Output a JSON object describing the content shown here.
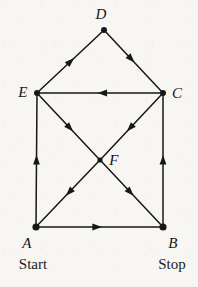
{
  "figure": {
    "kind": "directed-graph",
    "background_color": "#f7f6f2",
    "ink_color": "#17161a",
    "width": 198,
    "height": 287
  },
  "graph": {
    "nodes": [
      {
        "id": "A",
        "label": "A",
        "x": 36,
        "y": 227,
        "label_x": 27,
        "label_y": 243,
        "radius": 3.6
      },
      {
        "id": "B",
        "label": "B",
        "x": 163,
        "y": 227,
        "label_x": 173,
        "label_y": 243,
        "radius": 3.6
      },
      {
        "id": "C",
        "label": "C",
        "x": 163,
        "y": 93,
        "label_x": 177,
        "label_y": 93,
        "radius": 3.0
      },
      {
        "id": "D",
        "label": "D",
        "x": 104,
        "y": 30,
        "label_x": 101,
        "label_y": 14,
        "radius": 3.0
      },
      {
        "id": "E",
        "label": "E",
        "x": 37,
        "y": 93,
        "label_x": 23,
        "label_y": 92,
        "radius": 3.0
      },
      {
        "id": "F",
        "label": "F",
        "x": 100,
        "y": 160,
        "label_x": 114,
        "label_y": 160,
        "radius": 2.6
      }
    ],
    "edges": [
      {
        "id": "A-B",
        "from": "A",
        "to": "B",
        "directed": true,
        "arrow_t": 0.48
      },
      {
        "id": "A-E",
        "from": "A",
        "to": "E",
        "directed": true,
        "arrow_t": 0.5
      },
      {
        "id": "B-C",
        "from": "B",
        "to": "C",
        "directed": true,
        "arrow_t": 0.5
      },
      {
        "id": "E-D",
        "from": "E",
        "to": "D",
        "directed": true,
        "arrow_t": 0.5
      },
      {
        "id": "D-C",
        "from": "D",
        "to": "C",
        "directed": true,
        "arrow_t": 0.46
      },
      {
        "id": "C-E",
        "from": "C",
        "to": "E",
        "directed": true,
        "arrow_t": 0.48
      },
      {
        "id": "E-F",
        "from": "E",
        "to": "F",
        "directed": true,
        "arrow_t": 0.52
      },
      {
        "id": "F-B",
        "from": "F",
        "to": "B",
        "directed": true,
        "arrow_t": 0.48
      },
      {
        "id": "C-F",
        "from": "C",
        "to": "F",
        "directed": true,
        "arrow_t": 0.52
      },
      {
        "id": "F-A",
        "from": "F",
        "to": "A",
        "directed": true,
        "arrow_t": 0.48
      }
    ]
  },
  "annotations": {
    "start": {
      "text": "Start",
      "x": 33,
      "y": 264
    },
    "stop": {
      "text": "Stop",
      "x": 172,
      "y": 264
    }
  }
}
